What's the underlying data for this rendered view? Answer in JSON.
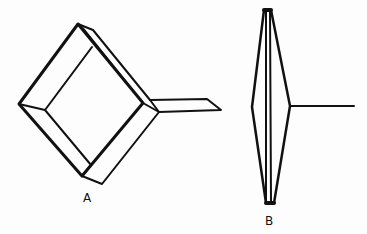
{
  "figure": {
    "labels": {
      "a": "A",
      "b": "B"
    },
    "colors": {
      "stroke": "#111111",
      "background": "#fdfdfd"
    },
    "parts": [
      {
        "id": "A",
        "description": "Square frame (mirror/plate) seen obliquely, with a flat handle extending right"
      },
      {
        "id": "B",
        "description": "Same frame seen edge-on, appearing as a thin lens shape with handle line"
      }
    ]
  }
}
